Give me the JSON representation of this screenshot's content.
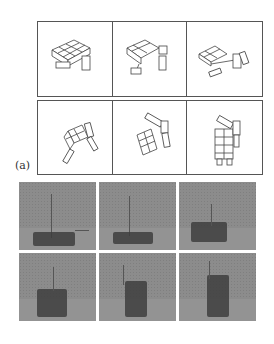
{
  "figure": {
    "label": "(a)",
    "drawings": {
      "description": "Line drawings of modular robot transforming from flat configuration to upright",
      "rows": [
        [
          {
            "step": 1
          },
          {
            "step": 2
          },
          {
            "step": 3
          }
        ],
        [
          {
            "step": 4
          },
          {
            "step": 5
          },
          {
            "step": 6
          }
        ]
      ]
    },
    "photos": {
      "description": "Grayscale photographs of physical modular robot performing the same transformation",
      "rows": [
        [
          {
            "step": 1
          },
          {
            "step": 2
          },
          {
            "step": 3
          }
        ],
        [
          {
            "step": 4
          },
          {
            "step": 5
          },
          {
            "step": 6
          }
        ]
      ]
    },
    "colors": {
      "line": "#555555",
      "photo_bg": "#8c8c8c",
      "robot": "#3e3e3e"
    }
  }
}
